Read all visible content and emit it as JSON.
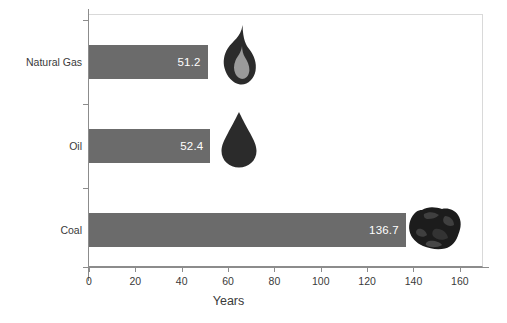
{
  "chart_data": {
    "type": "bar",
    "orientation": "horizontal",
    "title": "",
    "xlabel": "Years",
    "ylabel": "",
    "categories": [
      "Natural Gas",
      "Oil",
      "Coal"
    ],
    "values": [
      51.2,
      52.4,
      136.7
    ],
    "value_labels": [
      "51.2",
      "52.4",
      "136.7"
    ],
    "xlim": [
      0,
      170
    ],
    "xticks": [
      0,
      20,
      40,
      60,
      80,
      100,
      120,
      140,
      160
    ],
    "xtick_labels": [
      "0",
      "20",
      "40",
      "60",
      "80",
      "100",
      "120",
      "140",
      "160"
    ],
    "grid": false,
    "legend": "none",
    "bar_color": "#6b6b6b",
    "value_label_color": "#ffffff",
    "axis_color": "#8c8c8c",
    "text_color": "#3a3a3a",
    "icons": [
      {
        "name": "flame-icon",
        "category": "Natural Gas",
        "outer_color": "#2b2b2b",
        "inner_color": "#9a9a9a"
      },
      {
        "name": "oil-drop-icon",
        "category": "Oil",
        "outer_color": "#2b2b2b",
        "inner_color": "#2b2b2b"
      },
      {
        "name": "coal-lump-icon",
        "category": "Coal",
        "outer_color": "#1c1c1c",
        "inner_color": "#3f3f3f"
      }
    ]
  },
  "axis": {
    "x_title": "Years",
    "tick_0": "0",
    "tick_1": "20",
    "tick_2": "40",
    "tick_3": "60",
    "tick_4": "80",
    "tick_5": "100",
    "tick_6": "120",
    "tick_7": "140",
    "tick_8": "160"
  },
  "rows": [
    {
      "label": "Natural Gas",
      "value_label": "51.2"
    },
    {
      "label": "Oil",
      "value_label": "52.4"
    },
    {
      "label": "Coal",
      "value_label": "136.7"
    }
  ]
}
